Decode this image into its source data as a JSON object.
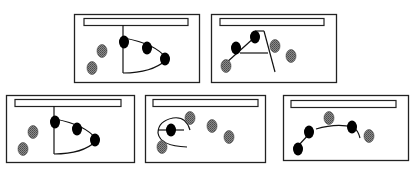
{
  "diagram": {
    "colors": {
      "frame": "#222222",
      "black_node": "#000000",
      "gray_node": "#7a7a7a",
      "background": "#ffffff"
    },
    "panels": [
      {
        "id": "panel-1",
        "frame": [
          74,
          14,
          126,
          69
        ],
        "bar": [
          84,
          18,
          104,
          7
        ]
      },
      {
        "id": "panel-2",
        "frame": [
          211,
          14,
          126,
          69
        ],
        "bar": [
          220,
          18,
          104,
          7
        ]
      },
      {
        "id": "panel-3",
        "frame": [
          6,
          95,
          129,
          68
        ],
        "bar": [
          15,
          99,
          106,
          7
        ]
      },
      {
        "id": "panel-4",
        "frame": [
          145,
          95,
          121,
          68
        ],
        "bar": [
          153,
          99,
          105,
          7
        ]
      },
      {
        "id": "panel-5",
        "frame": [
          283,
          95,
          126,
          66
        ],
        "bar": [
          291,
          100,
          105,
          7
        ]
      }
    ]
  }
}
